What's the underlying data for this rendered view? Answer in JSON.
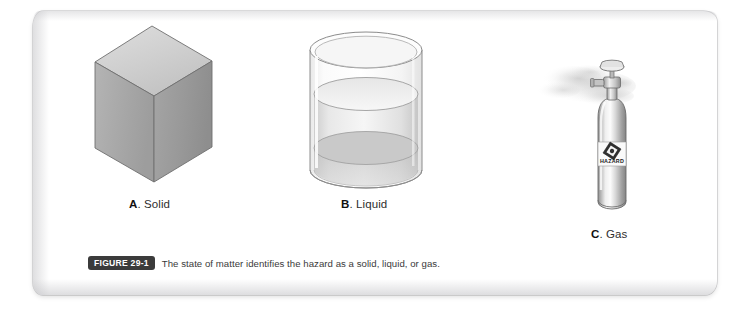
{
  "page": {
    "background_color": "#ffffff",
    "sheet_color": "#ffffff"
  },
  "figure": {
    "badge_label": "FIGURE 29-1",
    "caption": "The state of matter identifies the hazard as a solid, liquid, or gas.",
    "badge_bg": "#3b3b3b",
    "badge_text_color": "#ffffff"
  },
  "items": [
    {
      "key": "solid",
      "letter": "A",
      "label": ". Solid",
      "icon": "cube-icon",
      "colors": {
        "top": "#d2d2d2",
        "left": "#a9a9a9",
        "right": "#9a9a9a",
        "outline": "#6f6f6f"
      }
    },
    {
      "key": "liquid",
      "letter": "B",
      "label": ". Liquid",
      "icon": "beaker-icon",
      "colors": {
        "glass": "#f3f3f3",
        "liquid": "#dcdcdc",
        "surface": "#ececec",
        "outline": "#8c8c8c"
      }
    },
    {
      "key": "gas",
      "letter": "C",
      "label": ". Gas",
      "icon": "gas-cylinder-icon",
      "placard_text": "HAZARD",
      "colors": {
        "body": "#c9c9c9",
        "highlight": "#f2f2f2",
        "shadow": "#8d8d8d",
        "outline": "#6b6b6b",
        "vapor": "#d8d8d8"
      }
    }
  ]
}
